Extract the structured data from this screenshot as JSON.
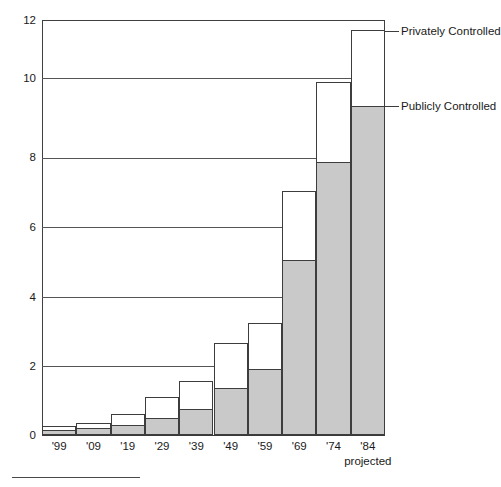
{
  "chart_data": {
    "type": "bar",
    "subtype": "stacked-bar",
    "title": "",
    "xlabel": "",
    "ylabel": "",
    "ylim": [
      0,
      12
    ],
    "yticks": [
      0,
      2,
      4,
      6,
      8,
      10,
      12
    ],
    "grid": true,
    "legend_position": "right-inline-callouts",
    "categories": [
      "'99",
      "'09",
      "'19",
      "'29",
      "'39",
      "'49",
      "'59",
      "'69",
      "'74",
      "'84"
    ],
    "category_notes": [
      "",
      "",
      "",
      "",
      "",
      "",
      "",
      "",
      "",
      "projected"
    ],
    "series": [
      {
        "name": "Publicly Controlled",
        "color": "#c9c9c9",
        "values": [
          0.15,
          0.2,
          0.3,
          0.5,
          0.75,
          1.35,
          1.9,
          5.05,
          7.9,
          9.5
        ]
      },
      {
        "name": "Privately Controlled",
        "color": "#ffffff",
        "values": [
          0.1,
          0.15,
          0.3,
          0.6,
          0.8,
          1.3,
          1.35,
          2.0,
          2.3,
          2.2
        ]
      }
    ],
    "totals": [
      0.25,
      0.35,
      0.6,
      1.1,
      1.55,
      2.65,
      3.25,
      7.05,
      10.2,
      11.7
    ]
  },
  "axis": {
    "y_tick_labels": [
      "12",
      "10",
      "8",
      "6",
      "4",
      "2",
      "0"
    ],
    "x_tick_labels": [
      "'99",
      "'09",
      "'19",
      "'29",
      "'39",
      "'49",
      "'59",
      "'69",
      "'74",
      "'84"
    ],
    "x_sub_label": "projected"
  },
  "callouts": {
    "private": "Privately Controlled",
    "public": "Publicly Controlled"
  }
}
